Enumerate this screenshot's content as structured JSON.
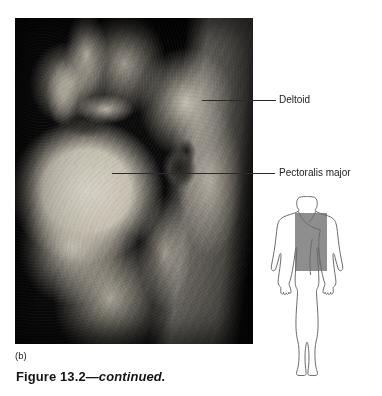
{
  "figure": {
    "panel_label": "(b)",
    "caption_main": "Figure 13.2",
    "caption_continued": "—continued."
  },
  "photograph": {
    "alt_name": "cadaver-dissection-chest-shoulder",
    "description": "Grayscale anatomical dissection photograph of the anterior chest and shoulder region",
    "background_color": "#0a0a0a",
    "tissue_color": "#c6c0b2"
  },
  "callouts": [
    {
      "id": "deltoid",
      "label": "Deltoid",
      "leader_from_x": 202,
      "leader_y": 100,
      "leader_to_x": 276
    },
    {
      "id": "pectoralis-major",
      "label": "Pectoralis major",
      "leader_from_x": 112,
      "leader_y": 173,
      "leader_to_x": 275
    }
  ],
  "orientation_diagram": {
    "name": "body-orientation-diagram",
    "outline_color": "#6b6b6b",
    "highlight_color": "#8e8e8e",
    "highlight_region": "upper chest and shoulder",
    "highlight_rect": {
      "x": 27,
      "y": 20,
      "width": 32,
      "height": 58
    }
  }
}
